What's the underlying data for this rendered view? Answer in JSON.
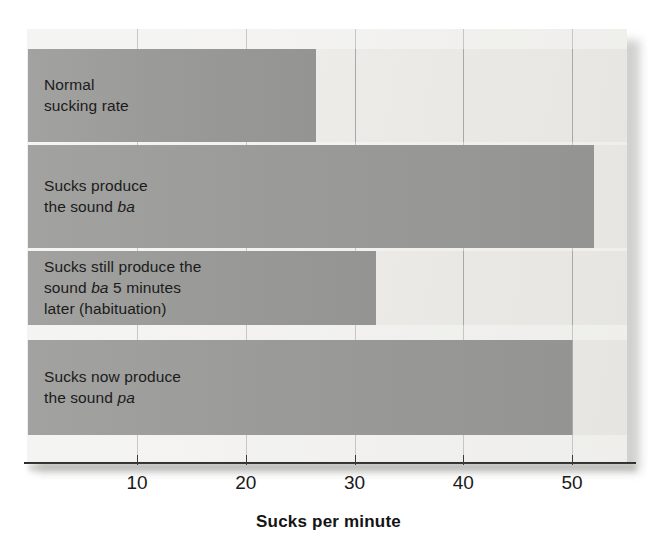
{
  "chart_data": {
    "type": "bar",
    "orientation": "horizontal",
    "title": "",
    "xlabel": "Sucks per minute",
    "ylabel": "",
    "xlim": [
      0,
      52.6
    ],
    "xticks": [
      10,
      20,
      30,
      40,
      50
    ],
    "xticklabels": [
      "10",
      "20",
      "30",
      "40",
      "50"
    ],
    "grid": "vertical",
    "legend": "none",
    "categories": [
      "Normal sucking rate",
      "Sucks produce the sound ba",
      "Sucks still produce the sound ba 5 minutes later (habituation)",
      "Sucks now produce the sound pa"
    ],
    "values": [
      26.5,
      52,
      32,
      50
    ],
    "bar_color": "#9a9a98",
    "background_color": "#ecebe8"
  },
  "bars": [
    {
      "value": 26.5,
      "lines": [
        [
          {
            "t": "Normal",
            "i": false
          }
        ],
        [
          {
            "t": "sucking rate",
            "i": false
          }
        ]
      ]
    },
    {
      "value": 52,
      "lines": [
        [
          {
            "t": "Sucks produce",
            "i": false
          }
        ],
        [
          {
            "t": "the sound ",
            "i": false
          },
          {
            "t": "ba",
            "i": true
          }
        ]
      ]
    },
    {
      "value": 32,
      "lines": [
        [
          {
            "t": "Sucks still produce the",
            "i": false
          }
        ],
        [
          {
            "t": "sound ",
            "i": false
          },
          {
            "t": "ba",
            "i": true
          },
          {
            "t": " 5 minutes",
            "i": false
          }
        ],
        [
          {
            "t": "later (habituation)",
            "i": false
          }
        ]
      ]
    },
    {
      "value": 50,
      "lines": [
        [
          {
            "t": "Sucks now produce",
            "i": false
          }
        ],
        [
          {
            "t": "the sound ",
            "i": false
          },
          {
            "t": "pa",
            "i": true
          }
        ]
      ]
    }
  ],
  "axis": {
    "title": "Sucks per minute",
    "ticks": [
      "10",
      "20",
      "30",
      "40",
      "50"
    ]
  }
}
